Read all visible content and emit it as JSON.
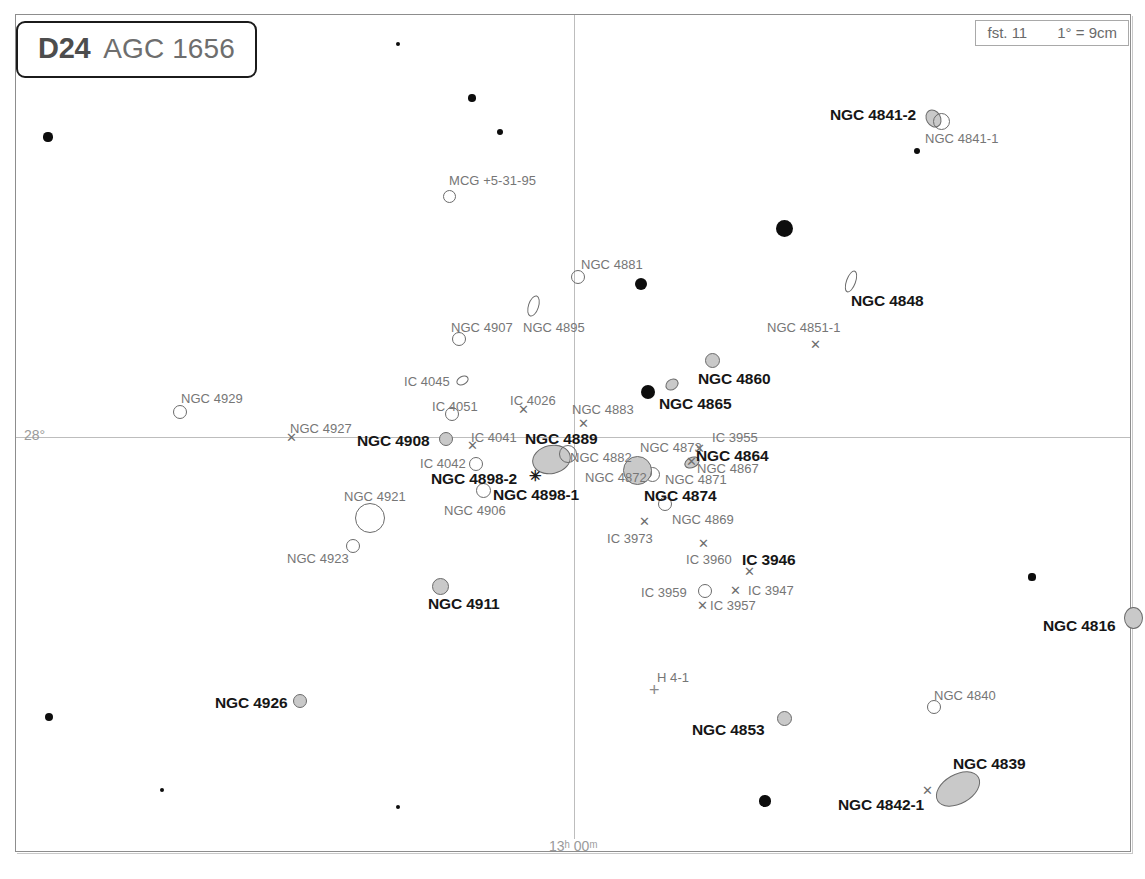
{
  "chart_data": {
    "type": "scatter",
    "title": "D24  AGC 1656",
    "subtitle": "Coma Cluster deep-sky finder chart",
    "chart_code": "D24",
    "chart_name": "AGC 1656",
    "limiting_magnitude_label": "fst. 11",
    "scale_label": "1° = 9cm",
    "xlabel": "Right Ascension",
    "ylabel": "Declination",
    "grid": true,
    "axis_ticks": {
      "ra": [
        {
          "label": "13ʰ 00ᵐ",
          "x": 574
        }
      ],
      "dec": [
        {
          "label": "28°",
          "y": 437
        }
      ]
    },
    "objects": [
      {
        "name": "NGC 4841-2",
        "type": "galaxy-ellipse",
        "x": 933,
        "y": 118,
        "w": 15,
        "h": 19,
        "rot": -30,
        "fill": "gray",
        "label_pos": "left",
        "label_style": "bold",
        "lx": 830,
        "ly": 106
      },
      {
        "name": "NGC 4841-1",
        "type": "galaxy-ellipse",
        "x": 941,
        "y": 121,
        "w": 17,
        "h": 17,
        "rot": 0,
        "fill": "open",
        "label_pos": "below",
        "label_style": "plain",
        "lx": 925,
        "ly": 131
      },
      {
        "name": "NGC 4848",
        "type": "galaxy-ellipse",
        "x": 851,
        "y": 281,
        "w": 10,
        "h": 23,
        "rot": 20,
        "fill": "open",
        "label_style": "bold",
        "lx": 851,
        "ly": 292
      },
      {
        "name": "NGC 4851-1",
        "type": "x-marker",
        "x": 816,
        "y": 344,
        "label_style": "plain",
        "lx": 767,
        "ly": 320
      },
      {
        "name": "NGC 4860",
        "type": "galaxy-ellipse",
        "x": 712,
        "y": 360,
        "w": 15,
        "h": 15,
        "rot": 0,
        "fill": "gray",
        "label_style": "bold",
        "lx": 698,
        "ly": 370
      },
      {
        "name": "NGC 4865",
        "type": "galaxy-ellipse",
        "x": 672,
        "y": 384,
        "w": 14,
        "h": 11,
        "rot": -35,
        "fill": "gray",
        "label_style": "bold",
        "lx": 659,
        "ly": 395
      },
      {
        "name": "MCG +5-31-95",
        "type": "galaxy-ellipse",
        "x": 449,
        "y": 196,
        "w": 13,
        "h": 13,
        "rot": 0,
        "fill": "open",
        "label_style": "plain",
        "lx": 449,
        "ly": 173
      },
      {
        "name": "NGC 4881",
        "type": "galaxy-ellipse",
        "x": 578,
        "y": 277,
        "w": 14,
        "h": 14,
        "rot": 0,
        "fill": "open",
        "label_style": "plain",
        "lx": 581,
        "ly": 257
      },
      {
        "name": "NGC 4895",
        "type": "galaxy-ellipse",
        "x": 533,
        "y": 306,
        "w": 11,
        "h": 22,
        "rot": 18,
        "fill": "open",
        "label_style": "plain",
        "lx": 523,
        "ly": 320
      },
      {
        "name": "NGC 4907",
        "type": "galaxy-ellipse",
        "x": 459,
        "y": 339,
        "w": 14,
        "h": 14,
        "rot": 0,
        "fill": "open",
        "label_style": "plain",
        "lx": 451,
        "ly": 320
      },
      {
        "name": "NGC 4929",
        "type": "galaxy-ellipse",
        "x": 180,
        "y": 412,
        "w": 14,
        "h": 14,
        "rot": 0,
        "fill": "open",
        "label_style": "plain",
        "lx": 181,
        "ly": 391
      },
      {
        "name": "NGC 4927",
        "type": "x-marker",
        "x": 292,
        "y": 437,
        "label_style": "plain",
        "lx": 290,
        "ly": 421
      },
      {
        "name": "NGC 4908",
        "type": "galaxy-ellipse",
        "x": 446,
        "y": 439,
        "w": 14,
        "h": 14,
        "rot": 0,
        "fill": "gray",
        "label_style": "bold",
        "lx": 357,
        "ly": 432
      },
      {
        "name": "IC 4045",
        "type": "galaxy-ellipse",
        "x": 462,
        "y": 380,
        "w": 13,
        "h": 9,
        "rot": -28,
        "fill": "open",
        "label_style": "plain",
        "lx": 404,
        "ly": 374
      },
      {
        "name": "IC 4051",
        "type": "galaxy-ellipse",
        "x": 452,
        "y": 414,
        "w": 14,
        "h": 14,
        "rot": 0,
        "fill": "open",
        "label_style": "plain",
        "lx": 432,
        "ly": 399
      },
      {
        "name": "IC 4026",
        "type": "x-marker",
        "x": 524,
        "y": 409,
        "label_style": "plain",
        "lx": 510,
        "ly": 393
      },
      {
        "name": "IC 4041",
        "type": "x-marker",
        "x": 473,
        "y": 445,
        "label_style": "plain",
        "lx": 471,
        "ly": 430
      },
      {
        "name": "IC 4042",
        "type": "galaxy-ellipse",
        "x": 476,
        "y": 464,
        "w": 14,
        "h": 14,
        "rot": 0,
        "fill": "open",
        "label_style": "plain",
        "lx": 420,
        "ly": 456
      },
      {
        "name": "NGC 4883",
        "type": "x-marker",
        "x": 584,
        "y": 423,
        "label_style": "plain",
        "lx": 572,
        "ly": 402
      },
      {
        "name": "NGC 4889",
        "type": "galaxy-ellipse",
        "x": 551,
        "y": 459,
        "w": 39,
        "h": 29,
        "rot": -12,
        "fill": "gray",
        "label_style": "bold",
        "lx": 525,
        "ly": 430
      },
      {
        "name": "NGC 4882",
        "type": "galaxy-ellipse",
        "x": 568,
        "y": 454,
        "w": 18,
        "h": 18,
        "rot": 0,
        "fill": "open",
        "label_style": "plain",
        "lx": 570,
        "ly": 450
      },
      {
        "name": "NGC 4872",
        "type": "galaxy-ellipse",
        "x": 645,
        "y": 473,
        "w": 14,
        "h": 14,
        "rot": 0,
        "fill": "open",
        "label_style": "plain",
        "lx": 585,
        "ly": 470
      },
      {
        "name": "NGC 4898-2",
        "type": "asterisk",
        "x": 536,
        "y": 476,
        "label_style": "bold",
        "lx": 431,
        "ly": 470
      },
      {
        "name": "NGC 4898-1",
        "type": "galaxy-ellipse",
        "x": 483,
        "y": 490,
        "w": 15,
        "h": 15,
        "rot": 0,
        "fill": "open",
        "label_style": "bold",
        "lx": 493,
        "ly": 486
      },
      {
        "name": "NGC 4906",
        "type": "galaxy-ellipse",
        "x": 483,
        "y": 490,
        "w": 0,
        "h": 0,
        "rot": 0,
        "fill": "none",
        "label_style": "plain",
        "lx": 444,
        "ly": 503
      },
      {
        "name": "NGC 4873",
        "type": "x-marker",
        "x": 692,
        "y": 461,
        "label_style": "plain",
        "lx": 640,
        "ly": 440
      },
      {
        "name": "IC 3955",
        "type": "x-marker",
        "x": 700,
        "y": 448,
        "label_style": "plain",
        "lx": 712,
        "ly": 430
      },
      {
        "name": "NGC 4864",
        "type": "galaxy-ellipse",
        "x": 692,
        "y": 462,
        "w": 16,
        "h": 11,
        "rot": -25,
        "fill": "gray",
        "label_style": "bold",
        "lx": 696,
        "ly": 447
      },
      {
        "name": "NGC 4867",
        "type": "galaxy-ellipse",
        "x": 692,
        "y": 462,
        "w": 0,
        "h": 0,
        "rot": 0,
        "fill": "none",
        "label_style": "plain",
        "lx": 697,
        "ly": 461
      },
      {
        "name": "NGC 4871",
        "type": "galaxy-ellipse",
        "x": 652,
        "y": 474,
        "w": 15,
        "h": 15,
        "rot": 0,
        "fill": "open",
        "label_style": "plain",
        "lx": 665,
        "ly": 472
      },
      {
        "name": "NGC 4874",
        "type": "galaxy-ellipse",
        "x": 637,
        "y": 470,
        "w": 29,
        "h": 29,
        "rot": 0,
        "fill": "gray",
        "label_style": "bold",
        "lx": 644,
        "ly": 487
      },
      {
        "name": "NGC 4869",
        "type": "galaxy-ellipse",
        "x": 665,
        "y": 504,
        "w": 14,
        "h": 14,
        "rot": 0,
        "fill": "open",
        "label_style": "plain",
        "lx": 672,
        "ly": 512
      },
      {
        "name": "IC 3973",
        "type": "x-marker",
        "x": 645,
        "y": 521,
        "label_style": "plain",
        "lx": 607,
        "ly": 531
      },
      {
        "name": "IC 3960",
        "type": "x-marker",
        "x": 704,
        "y": 543,
        "label_style": "plain",
        "lx": 686,
        "ly": 552
      },
      {
        "name": "IC 3946",
        "type": "x-marker",
        "x": 750,
        "y": 571,
        "label_style": "bold",
        "lx": 742,
        "ly": 551
      },
      {
        "name": "IC 3947",
        "type": "x-marker",
        "x": 736,
        "y": 590,
        "label_style": "plain",
        "lx": 748,
        "ly": 583
      },
      {
        "name": "IC 3959",
        "type": "galaxy-ellipse",
        "x": 705,
        "y": 591,
        "w": 14,
        "h": 14,
        "rot": 0,
        "fill": "open",
        "label_style": "plain",
        "lx": 641,
        "ly": 585
      },
      {
        "name": "IC 3957",
        "type": "x-marker",
        "x": 703,
        "y": 605,
        "label_style": "plain",
        "lx": 710,
        "ly": 598
      },
      {
        "name": "NGC 4921",
        "type": "galaxy-ellipse",
        "x": 370,
        "y": 518,
        "w": 30,
        "h": 30,
        "rot": 0,
        "fill": "open",
        "label_style": "plain",
        "lx": 344,
        "ly": 489
      },
      {
        "name": "NGC 4923",
        "type": "galaxy-ellipse",
        "x": 353,
        "y": 546,
        "w": 14,
        "h": 14,
        "rot": 0,
        "fill": "open",
        "label_style": "plain",
        "lx": 287,
        "ly": 551
      },
      {
        "name": "NGC 4911",
        "type": "galaxy-ellipse",
        "x": 440,
        "y": 586,
        "w": 17,
        "h": 17,
        "rot": 0,
        "fill": "gray",
        "label_style": "bold",
        "lx": 428,
        "ly": 595
      },
      {
        "name": "NGC 4926",
        "type": "galaxy-ellipse",
        "x": 300,
        "y": 701,
        "w": 14,
        "h": 14,
        "rot": 0,
        "fill": "gray",
        "label_style": "bold",
        "lx": 215,
        "ly": 694
      },
      {
        "name": "H 4-1",
        "type": "plus-marker",
        "x": 655,
        "y": 690,
        "label_style": "plain",
        "lx": 657,
        "ly": 670
      },
      {
        "name": "NGC 4853",
        "type": "galaxy-ellipse",
        "x": 784,
        "y": 718,
        "w": 15,
        "h": 15,
        "rot": 0,
        "fill": "gray",
        "label_style": "bold",
        "lx": 692,
        "ly": 721
      },
      {
        "name": "NGC 4840",
        "type": "galaxy-ellipse",
        "x": 934,
        "y": 707,
        "w": 14,
        "h": 14,
        "rot": 0,
        "fill": "open",
        "label_style": "plain",
        "lx": 934,
        "ly": 688
      },
      {
        "name": "NGC 4839",
        "type": "galaxy-ellipse",
        "x": 958,
        "y": 789,
        "w": 48,
        "h": 30,
        "rot": -30,
        "fill": "gray",
        "label_style": "bold",
        "lx": 953,
        "ly": 755
      },
      {
        "name": "NGC 4842-1",
        "type": "x-marker",
        "x": 928,
        "y": 790,
        "label_style": "bold",
        "lx": 838,
        "ly": 796
      },
      {
        "name": "NGC 4816",
        "type": "galaxy-ellipse",
        "x": 1133,
        "y": 618,
        "w": 19,
        "h": 22,
        "rot": 0,
        "fill": "gray",
        "label_style": "bold",
        "lx": 1043,
        "ly": 617
      }
    ],
    "field_stars": [
      {
        "x": 398,
        "y": 44,
        "r": 2.2
      },
      {
        "x": 472,
        "y": 98,
        "r": 3.8
      },
      {
        "x": 500,
        "y": 132,
        "r": 3.2
      },
      {
        "x": 48,
        "y": 137,
        "r": 4.6
      },
      {
        "x": 917,
        "y": 151,
        "r": 3.4
      },
      {
        "x": 784,
        "y": 228,
        "r": 8.5
      },
      {
        "x": 641,
        "y": 284,
        "r": 6.0
      },
      {
        "x": 648,
        "y": 392,
        "r": 7.0
      },
      {
        "x": 1032,
        "y": 577,
        "r": 3.6
      },
      {
        "x": 49,
        "y": 717,
        "r": 4.4
      },
      {
        "x": 162,
        "y": 790,
        "r": 2.2
      },
      {
        "x": 398,
        "y": 807,
        "r": 2.4
      },
      {
        "x": 765,
        "y": 801,
        "r": 5.6
      }
    ]
  },
  "colors": {
    "frame": "#8d8d8d",
    "grid": "#bdbdbd",
    "label_bold": "#161616",
    "label_plain": "#767676",
    "marker_outline": "#6b6b6b",
    "marker_fill_gray": "#c9c9c9",
    "star_fill": "#0d0d0d",
    "title_code": "#4d4d4d",
    "title_name": "#6e6e6e"
  }
}
